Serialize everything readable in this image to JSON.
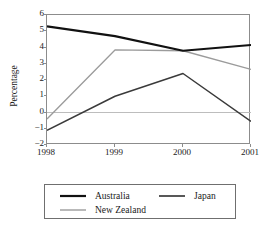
{
  "chart_data": {
    "type": "line",
    "title": "",
    "xlabel": "",
    "ylabel": "Percentage",
    "categories": [
      "1998",
      "1999",
      "2000",
      "2001"
    ],
    "x": [
      1998,
      1999,
      2000,
      2001
    ],
    "ylim": [
      -2,
      6
    ],
    "yticks": [
      "6",
      "5",
      "4",
      "3",
      "2",
      "1",
      "0",
      "−1",
      "−2"
    ],
    "ytick_values": [
      6,
      5,
      4,
      3,
      2,
      1,
      0,
      -1,
      -2
    ],
    "grid": false,
    "zero_line": true,
    "legend_position": "bottom",
    "series": [
      {
        "name": "Australia",
        "values": [
          5.3,
          4.7,
          3.8,
          4.15
        ],
        "color": "#111111",
        "width": 2.1
      },
      {
        "name": "Japan",
        "values": [
          -1.1,
          1.0,
          2.4,
          -0.55
        ],
        "color": "#3a3a3a",
        "width": 1.5
      },
      {
        "name": "New Zealand",
        "values": [
          -0.4,
          3.85,
          3.8,
          2.65
        ],
        "color": "#9b9b9b",
        "width": 1.3
      }
    ]
  },
  "legend": {
    "items": [
      {
        "label": "Australia"
      },
      {
        "label": "Japan"
      },
      {
        "label": "New Zealand"
      }
    ]
  },
  "colors": {
    "australia": "#111111",
    "japan": "#3a3a3a",
    "new_zealand": "#9b9b9b",
    "axis": "#8c8c8c",
    "zero_line": "#bdbdbd",
    "text": "#1a1a1a",
    "background": "#ffffff"
  }
}
